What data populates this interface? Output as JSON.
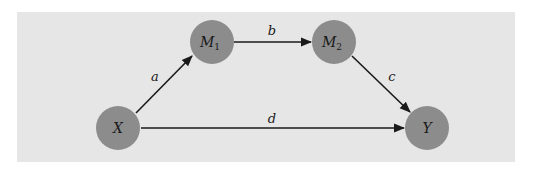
{
  "colors": {
    "page_background": "#ffffff",
    "panel_background": "#e6e6e6",
    "node_fill": "#8c8c8c",
    "edge_stroke": "#1a1a1a"
  },
  "nodes": [
    {
      "id": "X",
      "label": "X",
      "subscript": "",
      "cx": 118,
      "cy": 128,
      "r": 22
    },
    {
      "id": "M1",
      "label": "M",
      "subscript": "1",
      "cx": 212,
      "cy": 42,
      "r": 22
    },
    {
      "id": "M2",
      "label": "M",
      "subscript": "2",
      "cx": 334,
      "cy": 42,
      "r": 22
    },
    {
      "id": "Y",
      "label": "Y",
      "subscript": "",
      "cx": 427,
      "cy": 128,
      "r": 22
    }
  ],
  "edges": [
    {
      "id": "a",
      "from": "X",
      "to": "M1",
      "label": "a",
      "x1": 136,
      "y1": 113,
      "x2": 192,
      "y2": 56,
      "lx": 155,
      "ly": 81
    },
    {
      "id": "b",
      "from": "M1",
      "to": "M2",
      "label": "b",
      "x1": 234,
      "y1": 42,
      "x2": 311,
      "y2": 42,
      "lx": 272,
      "ly": 35
    },
    {
      "id": "c",
      "from": "M2",
      "to": "Y",
      "label": "c",
      "x1": 352,
      "y1": 56,
      "x2": 410,
      "y2": 112,
      "lx": 392,
      "ly": 81
    },
    {
      "id": "d",
      "from": "X",
      "to": "Y",
      "label": "d",
      "x1": 141,
      "y1": 128,
      "x2": 404,
      "y2": 128,
      "lx": 272,
      "ly": 123
    }
  ]
}
